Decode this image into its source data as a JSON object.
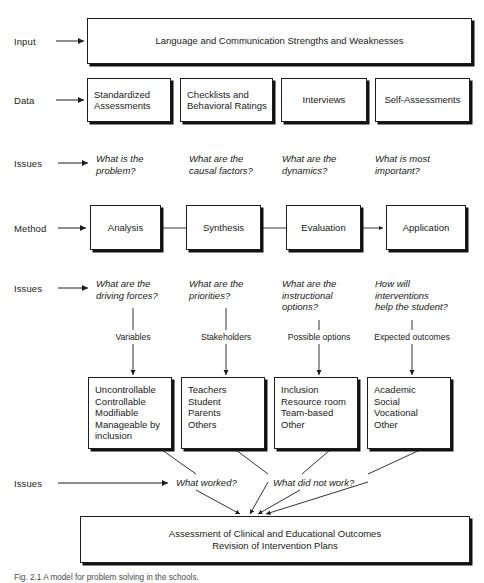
{
  "figure": {
    "caption": "Fig. 2.1  A model for problem solving in the schools."
  },
  "row_labels": [
    {
      "id": "input",
      "text": "Input"
    },
    {
      "id": "data",
      "text": "Data"
    },
    {
      "id": "issues1",
      "text": "Issues"
    },
    {
      "id": "method",
      "text": "Method"
    },
    {
      "id": "issues2",
      "text": "Issues"
    },
    {
      "id": "issues3",
      "text": "Issues"
    }
  ],
  "input_box": {
    "text": "Language and Communication Strengths and Weaknesses"
  },
  "data_boxes": [
    {
      "text": "Standardized\nAssessments"
    },
    {
      "text": "Checklists and\nBehavioral Ratings"
    },
    {
      "text": "Interviews"
    },
    {
      "text": "Self-Assessments"
    }
  ],
  "issues_row1": [
    {
      "text": "What is the\nproblem?"
    },
    {
      "text": "What are the\ncausal factors?"
    },
    {
      "text": "What are the\ndynamics?"
    },
    {
      "text": "What is most\nimportant?"
    }
  ],
  "method_boxes": [
    {
      "text": "Analysis"
    },
    {
      "text": "Synthesis"
    },
    {
      "text": "Evaluation"
    },
    {
      "text": "Application"
    }
  ],
  "issues_row2": [
    {
      "text": "What are the\ndriving forces?"
    },
    {
      "text": "What are the\npriorities?"
    },
    {
      "text": "What are the\ninstructional\noptions?"
    },
    {
      "text": "How will\ninterventions\nhelp the student?"
    }
  ],
  "connector_labels": [
    {
      "text": "Variables"
    },
    {
      "text": "Stakeholders"
    },
    {
      "text": "Possible options"
    },
    {
      "text": "Expected outcomes"
    }
  ],
  "option_boxes": [
    {
      "text": "Uncontrollable\nControllable\nModifiable\nManageable by\ninclusion"
    },
    {
      "text": "Teachers\nStudent\nParents\nOthers"
    },
    {
      "text": "Inclusion\nResource room\nTeam-based\nOther"
    },
    {
      "text": "Academic\nSocial\nVocational\nOther"
    }
  ],
  "issues_row3": [
    {
      "text": "What worked?"
    },
    {
      "text": "What did not work?"
    }
  ],
  "outcome_box": {
    "text": "Assessment of Clinical and Educational Outcomes\nRevision of Intervention Plans"
  },
  "colors": {
    "line": "#1d1d1d",
    "shadow": "#111111",
    "background": "#ffffff",
    "text": "#1a1a1a"
  }
}
